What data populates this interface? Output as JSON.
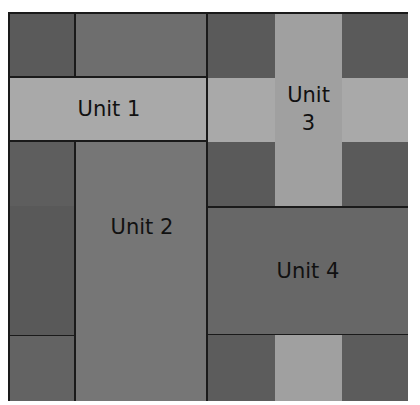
{
  "diagram": {
    "type": "grid-layout",
    "units": [
      {
        "id": "unit-1",
        "label": "Unit 1"
      },
      {
        "id": "unit-2",
        "label": "Unit 2"
      },
      {
        "id": "unit-3",
        "label": "Unit 3",
        "label_line1": "Unit",
        "label_line2": "3"
      },
      {
        "id": "unit-4",
        "label": "Unit 4"
      }
    ],
    "colors": {
      "dark": "#5c5c5c",
      "medium": "#767676",
      "unit4": "#676767",
      "light": "#a9a9a9",
      "light_strip": "#a0a0a0",
      "line": "#1a1a1a"
    }
  }
}
